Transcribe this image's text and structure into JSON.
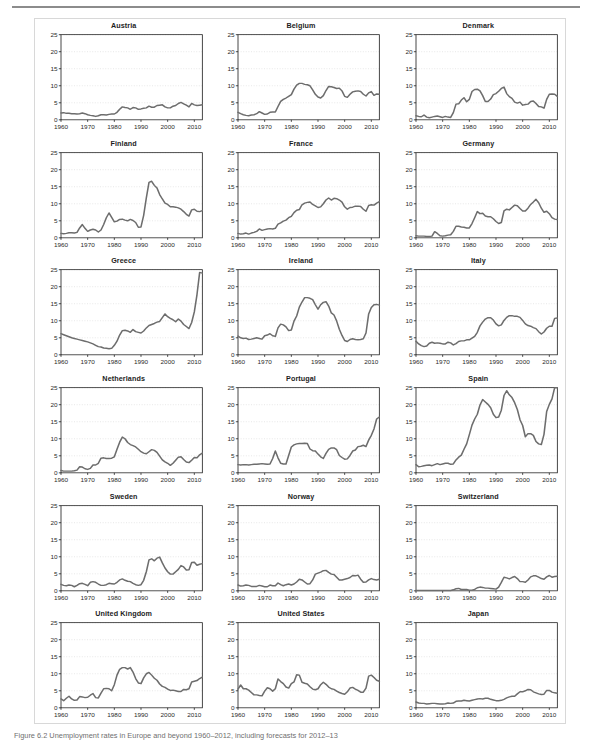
{
  "figure": {
    "caption": "Figure 6.2 Unemployment rates in Europe and beyond 1960–2012, including forecasts for 2012–13"
  },
  "chart_data": {
    "type": "line",
    "xlabel": "",
    "ylabel": "",
    "xlim": [
      1960,
      2013
    ],
    "ylim": [
      0,
      25
    ],
    "xticks": [
      1960,
      1970,
      1980,
      1990,
      2000,
      2010
    ],
    "yticks": [
      0,
      5,
      10,
      15,
      20,
      25
    ],
    "grid": true,
    "legend": "none",
    "line_color": "#6d6d6d",
    "x_start": 1960,
    "x_end": 2013,
    "panels": [
      {
        "name": "Austria",
        "values": [
          2.0,
          2.1,
          1.9,
          1.9,
          1.8,
          1.8,
          1.7,
          1.8,
          2.0,
          1.8,
          1.5,
          1.3,
          1.2,
          1.0,
          1.2,
          1.5,
          1.5,
          1.4,
          1.6,
          1.7,
          1.7,
          2.2,
          3.1,
          3.8,
          3.6,
          3.5,
          3.1,
          3.6,
          3.5,
          3.1,
          3.2,
          3.4,
          3.5,
          4.0,
          3.7,
          3.7,
          4.2,
          4.3,
          4.4,
          3.8,
          3.5,
          3.5,
          4.0,
          4.2,
          4.8,
          5.1,
          4.7,
          4.3,
          3.8,
          4.8,
          4.4,
          4.2,
          4.3,
          4.4
        ]
      },
      {
        "name": "Belgium",
        "values": [
          2.2,
          1.8,
          1.5,
          1.3,
          1.2,
          1.4,
          1.5,
          1.8,
          2.4,
          2.0,
          1.6,
          1.7,
          2.2,
          2.3,
          2.3,
          3.9,
          5.4,
          6.0,
          6.4,
          6.9,
          7.4,
          9.0,
          10.2,
          10.7,
          10.7,
          10.4,
          10.3,
          10.0,
          8.8,
          7.5,
          6.7,
          6.4,
          7.1,
          8.6,
          9.8,
          9.7,
          9.5,
          9.2,
          9.3,
          8.5,
          6.9,
          6.6,
          7.5,
          8.2,
          8.4,
          8.5,
          8.3,
          7.5,
          7.0,
          7.9,
          8.3,
          7.2,
          7.6,
          7.5
        ]
      },
      {
        "name": "Denmark",
        "values": [
          1.2,
          1.0,
          0.9,
          1.4,
          0.8,
          0.6,
          0.8,
          1.0,
          1.1,
          0.9,
          0.7,
          1.0,
          0.8,
          0.7,
          2.1,
          4.6,
          4.7,
          5.8,
          6.5,
          5.3,
          6.0,
          8.3,
          8.9,
          9.0,
          8.5,
          7.1,
          5.4,
          5.4,
          6.1,
          7.4,
          7.7,
          8.4,
          9.2,
          9.6,
          7.7,
          6.8,
          6.3,
          5.2,
          4.9,
          5.2,
          4.3,
          4.5,
          4.6,
          5.4,
          5.5,
          4.8,
          3.9,
          3.8,
          3.4,
          6.0,
          7.5,
          7.6,
          7.5,
          6.9
        ]
      },
      {
        "name": "Finland",
        "values": [
          1.3,
          1.2,
          1.3,
          1.5,
          1.5,
          1.4,
          1.6,
          2.9,
          3.9,
          2.8,
          1.9,
          2.3,
          2.5,
          2.3,
          1.7,
          2.3,
          3.9,
          5.9,
          7.3,
          6.0,
          4.7,
          4.9,
          5.4,
          5.5,
          5.2,
          5.0,
          5.4,
          5.1,
          4.5,
          3.1,
          3.2,
          6.6,
          11.7,
          16.3,
          16.6,
          15.4,
          14.6,
          12.7,
          11.4,
          10.2,
          9.8,
          9.1,
          9.1,
          9.0,
          8.8,
          8.4,
          7.7,
          6.9,
          6.4,
          8.2,
          8.4,
          7.8,
          7.7,
          8.0
        ]
      },
      {
        "name": "France",
        "values": [
          1.3,
          1.1,
          1.2,
          1.4,
          1.1,
          1.4,
          1.6,
          1.9,
          2.6,
          2.2,
          2.4,
          2.6,
          2.7,
          2.6,
          2.8,
          4.0,
          4.4,
          4.9,
          5.2,
          5.9,
          6.3,
          7.4,
          8.1,
          8.3,
          9.7,
          10.2,
          10.4,
          10.5,
          9.8,
          9.4,
          8.9,
          9.1,
          10.0,
          11.1,
          11.7,
          11.1,
          11.6,
          11.5,
          11.1,
          10.5,
          9.1,
          8.4,
          8.9,
          9.0,
          9.3,
          9.3,
          9.2,
          8.4,
          7.8,
          9.5,
          9.7,
          9.6,
          10.2,
          10.6
        ]
      },
      {
        "name": "Germany",
        "values": [
          0.6,
          0.5,
          0.5,
          0.5,
          0.4,
          0.4,
          0.5,
          1.8,
          1.3,
          0.6,
          0.5,
          0.6,
          0.8,
          0.9,
          1.9,
          3.4,
          3.4,
          3.2,
          3.1,
          2.9,
          2.9,
          4.2,
          5.9,
          7.7,
          7.1,
          7.2,
          6.4,
          6.2,
          6.2,
          5.6,
          4.8,
          4.2,
          4.5,
          7.9,
          8.4,
          8.2,
          8.9,
          9.6,
          9.4,
          8.6,
          7.9,
          7.9,
          8.7,
          9.8,
          10.5,
          11.3,
          10.3,
          8.7,
          7.5,
          7.8,
          7.1,
          5.9,
          5.5,
          5.4
        ]
      },
      {
        "name": "Greece",
        "values": [
          6.2,
          5.9,
          5.6,
          5.3,
          5.0,
          4.8,
          4.6,
          4.4,
          4.2,
          4.0,
          3.8,
          3.5,
          3.2,
          2.8,
          2.4,
          2.3,
          2.0,
          1.9,
          1.8,
          1.9,
          2.8,
          4.0,
          5.8,
          7.1,
          7.2,
          7.0,
          6.6,
          7.4,
          6.8,
          6.6,
          6.4,
          7.0,
          7.9,
          8.6,
          8.9,
          9.2,
          9.6,
          9.8,
          10.9,
          12.0,
          11.2,
          10.7,
          10.3,
          9.7,
          10.5,
          9.9,
          8.9,
          8.3,
          7.7,
          9.5,
          12.6,
          17.7,
          24.2,
          24.0
        ]
      },
      {
        "name": "Ireland",
        "values": [
          5.5,
          5.0,
          4.8,
          4.9,
          4.5,
          4.6,
          4.8,
          5.0,
          4.8,
          4.6,
          5.6,
          5.8,
          6.2,
          5.6,
          5.4,
          7.9,
          9.0,
          8.8,
          8.2,
          7.1,
          7.3,
          9.9,
          11.4,
          14.0,
          15.5,
          16.8,
          16.8,
          16.6,
          16.2,
          14.7,
          13.4,
          14.7,
          15.4,
          15.6,
          14.3,
          12.3,
          11.7,
          9.9,
          7.5,
          5.7,
          4.2,
          3.9,
          4.5,
          4.7,
          4.5,
          4.4,
          4.5,
          4.7,
          6.4,
          12.0,
          13.9,
          14.7,
          14.8,
          14.6
        ]
      },
      {
        "name": "Italy",
        "values": [
          4.0,
          3.2,
          2.7,
          2.4,
          2.6,
          3.4,
          3.7,
          3.4,
          3.5,
          3.4,
          3.2,
          3.2,
          3.7,
          3.5,
          2.9,
          3.3,
          3.9,
          4.1,
          4.1,
          4.4,
          4.4,
          4.9,
          5.4,
          6.6,
          8.5,
          9.6,
          10.5,
          10.9,
          10.9,
          10.2,
          9.1,
          8.5,
          8.8,
          10.1,
          11.0,
          11.5,
          11.5,
          11.3,
          11.3,
          11.0,
          10.1,
          9.1,
          8.6,
          8.4,
          8.0,
          7.7,
          6.8,
          6.1,
          6.7,
          7.8,
          8.4,
          8.4,
          10.7,
          10.8
        ]
      },
      {
        "name": "Netherlands",
        "values": [
          0.7,
          0.5,
          0.5,
          0.5,
          0.5,
          0.6,
          0.8,
          1.8,
          1.7,
          1.2,
          1.0,
          1.3,
          2.3,
          2.3,
          2.8,
          4.3,
          4.4,
          4.2,
          4.2,
          4.3,
          4.7,
          6.9,
          9.0,
          10.5,
          10.0,
          8.9,
          8.3,
          8.0,
          7.6,
          6.9,
          6.2,
          5.8,
          5.6,
          6.2,
          6.8,
          6.6,
          6.0,
          4.9,
          3.8,
          3.2,
          2.8,
          2.2,
          2.8,
          3.7,
          4.6,
          4.7,
          3.9,
          3.2,
          3.0,
          3.7,
          4.5,
          4.4,
          5.3,
          5.8
        ]
      },
      {
        "name": "Portugal",
        "values": [
          2.4,
          2.3,
          2.4,
          2.4,
          2.3,
          2.4,
          2.5,
          2.5,
          2.6,
          2.7,
          2.6,
          2.5,
          2.6,
          4.2,
          6.4,
          4.4,
          2.8,
          2.6,
          2.6,
          5.1,
          7.6,
          8.2,
          8.5,
          8.6,
          8.6,
          8.7,
          8.6,
          7.0,
          6.5,
          6.4,
          5.5,
          4.7,
          4.2,
          5.7,
          6.9,
          7.3,
          7.3,
          6.8,
          5.1,
          4.5,
          4.0,
          4.1,
          5.1,
          6.4,
          6.7,
          7.7,
          7.8,
          8.1,
          7.7,
          9.6,
          11.0,
          12.9,
          15.8,
          16.4
        ]
      },
      {
        "name": "Spain",
        "values": [
          2.4,
          1.8,
          1.9,
          2.1,
          2.2,
          2.3,
          2.1,
          2.4,
          2.7,
          2.4,
          2.6,
          2.8,
          2.8,
          2.5,
          2.6,
          3.8,
          4.6,
          5.2,
          6.9,
          8.5,
          11.2,
          14.0,
          15.8,
          17.2,
          19.9,
          21.5,
          20.8,
          20.1,
          19.1,
          17.2,
          16.2,
          16.4,
          18.4,
          22.7,
          24.1,
          22.9,
          22.1,
          20.6,
          18.6,
          15.6,
          13.9,
          10.6,
          11.5,
          11.5,
          11.0,
          9.2,
          8.5,
          8.3,
          11.3,
          18.0,
          20.1,
          21.7,
          25.0,
          26.3
        ]
      },
      {
        "name": "Sweden",
        "values": [
          1.9,
          1.6,
          1.5,
          1.7,
          1.6,
          1.2,
          1.6,
          2.1,
          2.2,
          1.9,
          1.5,
          2.5,
          2.7,
          2.5,
          2.0,
          1.6,
          1.6,
          1.8,
          2.2,
          2.1,
          2.0,
          2.5,
          3.2,
          3.5,
          3.1,
          2.8,
          2.7,
          2.2,
          1.8,
          1.6,
          1.8,
          3.1,
          5.6,
          9.1,
          9.4,
          8.8,
          9.6,
          9.9,
          8.2,
          6.7,
          5.6,
          4.9,
          4.9,
          5.6,
          6.3,
          7.4,
          7.0,
          6.1,
          6.2,
          8.3,
          8.4,
          7.5,
          7.8,
          8.0
        ]
      },
      {
        "name": "Norway",
        "values": [
          1.7,
          1.4,
          1.5,
          1.7,
          1.6,
          1.3,
          1.3,
          1.3,
          1.6,
          1.4,
          1.2,
          1.2,
          1.7,
          1.5,
          1.5,
          2.3,
          1.8,
          1.5,
          1.8,
          2.0,
          1.7,
          2.0,
          2.6,
          3.4,
          3.2,
          2.6,
          2.0,
          2.1,
          3.2,
          4.9,
          5.2,
          5.5,
          5.9,
          6.0,
          5.4,
          4.9,
          4.8,
          4.0,
          3.2,
          3.2,
          3.4,
          3.6,
          3.9,
          4.5,
          4.4,
          4.6,
          3.4,
          2.5,
          2.6,
          3.2,
          3.6,
          3.3,
          3.2,
          3.4
        ]
      },
      {
        "name": "Switzerland",
        "values": [
          0.1,
          0.1,
          0.1,
          0.1,
          0.1,
          0.1,
          0.1,
          0.1,
          0.1,
          0.1,
          0.1,
          0.1,
          0.1,
          0.1,
          0.3,
          0.6,
          0.7,
          0.4,
          0.4,
          0.4,
          0.2,
          0.2,
          0.4,
          0.9,
          1.1,
          1.0,
          0.8,
          0.8,
          0.7,
          0.6,
          0.5,
          1.1,
          2.5,
          4.0,
          3.8,
          3.5,
          3.9,
          4.2,
          3.6,
          2.7,
          2.7,
          2.5,
          3.2,
          4.1,
          4.4,
          4.4,
          4.0,
          3.6,
          3.4,
          4.1,
          4.5,
          4.0,
          4.2,
          4.3
        ]
      },
      {
        "name": "United Kingdom",
        "values": [
          2.6,
          2.1,
          2.8,
          3.4,
          2.6,
          2.2,
          2.3,
          3.3,
          3.2,
          3.0,
          3.1,
          3.7,
          4.2,
          3.0,
          2.9,
          4.3,
          5.6,
          5.7,
          5.6,
          5.0,
          6.8,
          9.6,
          11.3,
          11.8,
          11.8,
          11.4,
          11.8,
          10.5,
          8.6,
          7.3,
          7.1,
          8.8,
          10.0,
          10.4,
          9.6,
          8.7,
          8.1,
          7.0,
          6.3,
          6.0,
          5.5,
          5.1,
          5.2,
          5.0,
          4.8,
          4.8,
          5.4,
          5.3,
          5.6,
          7.6,
          7.8,
          8.0,
          8.6,
          9.0
        ]
      },
      {
        "name": "United States",
        "values": [
          5.5,
          6.7,
          5.6,
          5.6,
          5.2,
          4.5,
          3.8,
          3.8,
          3.6,
          3.5,
          4.9,
          5.9,
          5.6,
          4.9,
          5.6,
          8.5,
          7.7,
          7.1,
          6.1,
          5.8,
          7.1,
          7.6,
          9.7,
          9.6,
          7.5,
          7.2,
          7.0,
          6.2,
          5.5,
          5.3,
          5.6,
          6.8,
          7.5,
          6.9,
          6.1,
          5.6,
          5.4,
          4.9,
          4.5,
          4.2,
          4.0,
          4.7,
          5.8,
          6.0,
          5.5,
          5.1,
          4.6,
          4.6,
          5.8,
          9.3,
          9.6,
          8.9,
          8.1,
          7.8
        ]
      },
      {
        "name": "Japan",
        "values": [
          1.7,
          1.4,
          1.3,
          1.3,
          1.1,
          1.2,
          1.3,
          1.3,
          1.2,
          1.1,
          1.1,
          1.2,
          1.4,
          1.3,
          1.4,
          1.9,
          2.0,
          2.0,
          2.2,
          2.1,
          2.0,
          2.2,
          2.4,
          2.6,
          2.7,
          2.6,
          2.8,
          2.8,
          2.5,
          2.3,
          2.1,
          2.1,
          2.2,
          2.5,
          2.9,
          3.2,
          3.4,
          3.4,
          4.1,
          4.7,
          4.7,
          5.0,
          5.4,
          5.3,
          4.7,
          4.4,
          4.1,
          3.9,
          4.0,
          5.1,
          5.1,
          4.6,
          4.4,
          4.3
        ]
      }
    ]
  }
}
